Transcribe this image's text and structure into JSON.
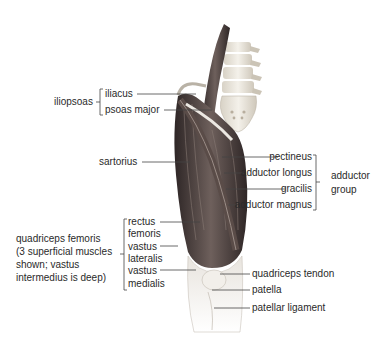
{
  "diagram": {
    "colors": {
      "text": "#2a2a2a",
      "leader": "#444444",
      "muscle_dark": "#3a3030",
      "muscle_mid": "#6a5c58",
      "tendon": "#e6e2dc",
      "bone": "#e9e5dc"
    }
  },
  "groups": {
    "iliopsoas": {
      "label": "iliopsoas",
      "members": [
        "iliacus",
        "psoas major"
      ]
    },
    "adductor": {
      "label": "adductor group",
      "label_line1": "adductor",
      "label_line2": "group",
      "members": [
        "pectineus",
        "adductor longus",
        "gracilis",
        "adductor magnus"
      ]
    },
    "quadriceps": {
      "label_lines": [
        "quadriceps femoris",
        "(3 superficial muscles",
        "shown; vastus",
        "intermedius is deep)"
      ],
      "members": [
        "rectus femoris",
        "vastus lateralis",
        "vastus medialis"
      ]
    }
  },
  "labels": {
    "iliacus": "iliacus",
    "psoas_major": "psoas major",
    "sartorius": "sartorius",
    "pectineus": "pectineus",
    "adductor_longus": "adductor longus",
    "gracilis": "gracilis",
    "adductor_magnus": "adductor magnus",
    "rectus_1": "rectus",
    "rectus_2": "femoris",
    "vastus_lat_1": "vastus",
    "vastus_lat_2": "lateralis",
    "vastus_med_1": "vastus",
    "vastus_med_2": "medialis",
    "quadriceps_tendon": "quadriceps tendon",
    "patella": "patella",
    "patellar_ligament": "patellar ligament"
  }
}
